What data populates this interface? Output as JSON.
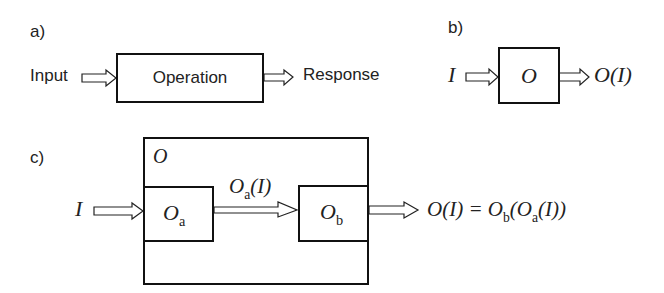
{
  "panel_a": {
    "label": "a)",
    "input": "Input",
    "operation": "Operation",
    "response": "Response"
  },
  "panel_b": {
    "label": "b)",
    "input": "I",
    "operator": "O",
    "output_main": "O(I)"
  },
  "panel_c": {
    "label": "c)",
    "outer_operator": "O",
    "input": "I",
    "op_a": {
      "main": "O",
      "sub": "a"
    },
    "op_b": {
      "main": "O",
      "sub": "b"
    },
    "intermediate": {
      "main": "O",
      "sub": "a",
      "arg": "(I)"
    },
    "equation": {
      "lhs": "O(I) = O",
      "sub_b": "b",
      "mid": "(O",
      "sub_a": "a",
      "end": "(I))"
    }
  }
}
